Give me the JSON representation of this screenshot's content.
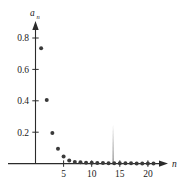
{
  "chart_data": {
    "type": "scatter",
    "title": "",
    "xlabel": "n",
    "ylabel": "a_n",
    "xlim": [
      0,
      22.5
    ],
    "ylim": [
      0,
      0.95
    ],
    "grid": false,
    "legend": null,
    "x": [
      1,
      2,
      3,
      4,
      5,
      6,
      7,
      8,
      9,
      10,
      11,
      12,
      13,
      14,
      15,
      16,
      17,
      18,
      19,
      20,
      21
    ],
    "values": [
      0.735,
      0.405,
      0.195,
      0.095,
      0.045,
      0.02,
      0.01,
      0.008,
      0.006,
      0.005,
      0.004,
      0.004,
      0.003,
      0.003,
      0.002,
      0.002,
      0.002,
      0.001,
      0.001,
      0.001,
      0.001
    ],
    "xticks": [
      5,
      10,
      15,
      20
    ],
    "xtick_labels": [
      "5",
      "10",
      "15",
      "20"
    ],
    "yticks": [
      0.2,
      0.4,
      0.6,
      0.8
    ],
    "ytick_labels": [
      "0.2",
      "0.4",
      "0.6",
      "0.8"
    ],
    "marker": "circle",
    "marker_color": "#3a3a3a",
    "axis_color": "#2b2b2b"
  },
  "labels": {
    "y_axis_name": "a",
    "y_axis_sub": "n",
    "x_axis_name": "n"
  }
}
